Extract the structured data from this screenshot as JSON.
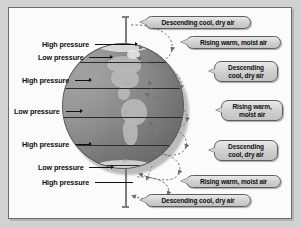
{
  "figure": {
    "frame_color": "#6a6a6a",
    "mat_color": "#d2d2d2",
    "page_color": "#fbfbfb"
  },
  "globe": {
    "name": "earth-globe",
    "latitude_labels": [
      "60°",
      "30°",
      "0°",
      "30°",
      "60°"
    ]
  },
  "pressure_labels": [
    {
      "text": "High pressure"
    },
    {
      "text": "Low pressure"
    },
    {
      "text": "High pressure"
    },
    {
      "text": "Low pressure"
    },
    {
      "text": "High pressure"
    },
    {
      "text": "Low pressure"
    },
    {
      "text": "High pressure"
    }
  ],
  "callouts": [
    {
      "text": "Descending cool, dry air",
      "kind": "descending"
    },
    {
      "text": "Rising warm, moist air",
      "kind": "rising"
    },
    {
      "line1": "Descending",
      "line2": "cool, dry air",
      "kind": "descending"
    },
    {
      "line1": "Rising warm,",
      "line2": "moist air",
      "kind": "rising"
    },
    {
      "line1": "Descending",
      "line2": "cool, dry air",
      "kind": "descending"
    },
    {
      "text": "Rising warm, moist air",
      "kind": "rising"
    },
    {
      "text": "Descending cool, dry air",
      "kind": "descending"
    }
  ]
}
